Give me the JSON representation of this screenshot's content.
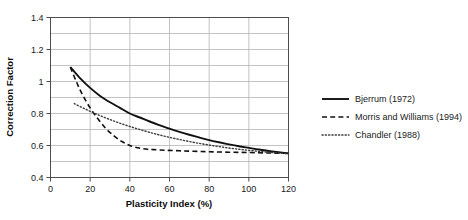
{
  "chart_data": {
    "type": "line",
    "title": "",
    "xlabel": "Plasticity Index (%)",
    "ylabel": "Correction Factor",
    "xlim": [
      0,
      120
    ],
    "ylim": [
      0.4,
      1.4
    ],
    "xticks": [
      "0",
      "20",
      "40",
      "60",
      "80",
      "100",
      "120"
    ],
    "xtick_values": [
      0,
      20,
      40,
      60,
      80,
      100,
      120
    ],
    "yticks": [
      "0.4",
      "0.6",
      "0.8",
      "1",
      "1.2",
      "1.4"
    ],
    "ytick_values": [
      0.4,
      0.6,
      0.8,
      1.0,
      1.2,
      1.4
    ],
    "minor_ytick_values": [
      0.5,
      0.7,
      0.9,
      1.1,
      1.3
    ],
    "grid": true,
    "grid_color": "#b4b4b4",
    "axis_color": "#4d4d4d",
    "background": "#ffffff",
    "legend_position": "right",
    "series": [
      {
        "name": "Bjerrum (1972)",
        "style": "solid",
        "color": "#111111",
        "width": 1.9,
        "points": [
          [
            10,
            1.09
          ],
          [
            15,
            1.02
          ],
          [
            20,
            0.96
          ],
          [
            25,
            0.91
          ],
          [
            30,
            0.87
          ],
          [
            35,
            0.835
          ],
          [
            40,
            0.8
          ],
          [
            45,
            0.775
          ],
          [
            50,
            0.75
          ],
          [
            55,
            0.727
          ],
          [
            60,
            0.705
          ],
          [
            65,
            0.685
          ],
          [
            70,
            0.667
          ],
          [
            75,
            0.65
          ],
          [
            80,
            0.634
          ],
          [
            85,
            0.62
          ],
          [
            90,
            0.607
          ],
          [
            95,
            0.595
          ],
          [
            100,
            0.585
          ],
          [
            105,
            0.575
          ],
          [
            110,
            0.566
          ],
          [
            115,
            0.558
          ],
          [
            120,
            0.551
          ]
        ]
      },
      {
        "name": "Morris and Williams (1994)",
        "style": "dashed",
        "color": "#111111",
        "width": 1.6,
        "points": [
          [
            10,
            1.09
          ],
          [
            13,
            1.0
          ],
          [
            16,
            0.92
          ],
          [
            20,
            0.835
          ],
          [
            24,
            0.765
          ],
          [
            28,
            0.705
          ],
          [
            32,
            0.66
          ],
          [
            36,
            0.625
          ],
          [
            40,
            0.6
          ],
          [
            44,
            0.586
          ],
          [
            48,
            0.578
          ],
          [
            52,
            0.574
          ],
          [
            58,
            0.57
          ],
          [
            65,
            0.567
          ],
          [
            72,
            0.564
          ],
          [
            80,
            0.561
          ],
          [
            90,
            0.558
          ],
          [
            100,
            0.556
          ],
          [
            110,
            0.553
          ],
          [
            120,
            0.551
          ]
        ]
      },
      {
        "name": "Chandler (1988)",
        "style": "dotted",
        "color": "#3d3d3d",
        "width": 1.4,
        "points": [
          [
            12,
            0.862
          ],
          [
            18,
            0.825
          ],
          [
            24,
            0.792
          ],
          [
            30,
            0.762
          ],
          [
            36,
            0.735
          ],
          [
            42,
            0.711
          ],
          [
            48,
            0.689
          ],
          [
            54,
            0.669
          ],
          [
            60,
            0.651
          ],
          [
            66,
            0.635
          ],
          [
            72,
            0.62
          ],
          [
            78,
            0.607
          ],
          [
            84,
            0.595
          ],
          [
            90,
            0.584
          ],
          [
            96,
            0.575
          ],
          [
            102,
            0.567
          ],
          [
            108,
            0.56
          ],
          [
            114,
            0.554
          ],
          [
            120,
            0.549
          ]
        ]
      }
    ],
    "legend_entries": [
      {
        "label": "Bjerrum (1972)",
        "style": "solid"
      },
      {
        "label": "Morris and Williams (1994)",
        "style": "dashed"
      },
      {
        "label": "Chandler (1988)",
        "style": "dotted"
      }
    ]
  }
}
